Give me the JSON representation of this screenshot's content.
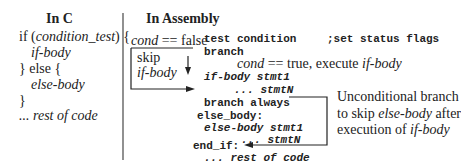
{
  "left": {
    "heading": "In C",
    "lines": [
      {
        "pre": "if (",
        "it": "condition_test",
        "post": ") {"
      },
      {
        "pre": "",
        "it": "if-body",
        "post": ""
      },
      {
        "pre": "} else {",
        "it": "",
        "post": ""
      },
      {
        "pre": "",
        "it": "else-body",
        "post": ""
      },
      {
        "pre": "}",
        "it": "",
        "post": ""
      },
      {
        "pre": "",
        "it": "... rest of code",
        "post": ""
      }
    ]
  },
  "right": {
    "heading": "In Assembly",
    "cond_false": {
      "it": "cond",
      "post": " == false"
    },
    "skip_label": "skip",
    "skip_body": "if-body",
    "cond_true": {
      "it": "cond",
      "mid": " == true, execute ",
      "it2": "if-body"
    },
    "code": {
      "test": "test condition",
      "comment": ";set status flags",
      "branch": "branch",
      "if_stmt1": "if-body stmt1",
      "if_stmtN": "... stmtN",
      "branch_always": "branch always",
      "else_label": "else_body:",
      "else_stmt1": "else-body stmt1",
      "else_stmtN": "... stmtN",
      "end_if": "end_if:",
      "rest": "... rest of code"
    },
    "note": {
      "line1": "Unconditional branch",
      "line2_pre": "to skip ",
      "line2_it": "else-body",
      "line2_post": " after",
      "line3_pre": "execution of ",
      "line3_it": "if-body"
    }
  }
}
